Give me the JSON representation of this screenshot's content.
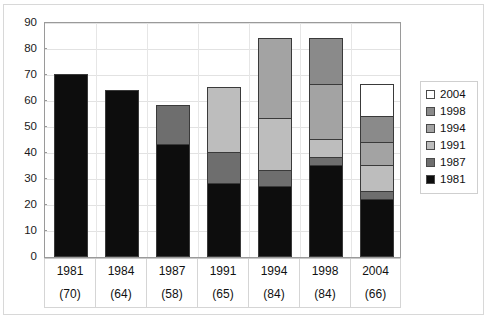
{
  "chart_data": {
    "type": "bar",
    "subtype": "stacked-column",
    "title": "",
    "xlabel": "",
    "ylabel": "",
    "ylim": [
      0,
      90
    ],
    "yticks": [
      0,
      10,
      20,
      30,
      40,
      50,
      60,
      70,
      80,
      90
    ],
    "grid": true,
    "legend_position": "right",
    "categories": [
      "1981",
      "1984",
      "1987",
      "1991",
      "1994",
      "1998",
      "2004"
    ],
    "category_counts": [
      "(70)",
      "(64)",
      "(58)",
      "(65)",
      "(84)",
      "(84)",
      "(66)"
    ],
    "legend_order_top_to_bottom": [
      "2004",
      "1998",
      "1994",
      "1991",
      "1987",
      "1981"
    ],
    "series": [
      {
        "name": "1981",
        "color": "#0d0d0d",
        "values": [
          70,
          64,
          43,
          28,
          27,
          35,
          22
        ]
      },
      {
        "name": "1987",
        "color": "#6e6e6e",
        "values": [
          0,
          0,
          15,
          12,
          6,
          3,
          3
        ]
      },
      {
        "name": "1991",
        "color": "#bdbdbd",
        "values": [
          0,
          0,
          0,
          25,
          20,
          7,
          10
        ]
      },
      {
        "name": "1994",
        "color": "#a3a3a3",
        "values": [
          0,
          0,
          0,
          0,
          31,
          21,
          9
        ]
      },
      {
        "name": "1998",
        "color": "#8a8a8a",
        "values": [
          0,
          0,
          0,
          0,
          0,
          18,
          10
        ]
      },
      {
        "name": "2004",
        "color": "#ffffff",
        "values": [
          0,
          0,
          0,
          0,
          0,
          0,
          12
        ]
      }
    ],
    "totals": [
      70,
      64,
      58,
      65,
      84,
      84,
      66
    ]
  },
  "legend": {
    "items": [
      {
        "label": "2004",
        "color": "#ffffff"
      },
      {
        "label": "1998",
        "color": "#8a8a8a"
      },
      {
        "label": "1994",
        "color": "#a3a3a3"
      },
      {
        "label": "1991",
        "color": "#bdbdbd"
      },
      {
        "label": "1987",
        "color": "#6e6e6e"
      },
      {
        "label": "1981",
        "color": "#0d0d0d"
      }
    ]
  }
}
